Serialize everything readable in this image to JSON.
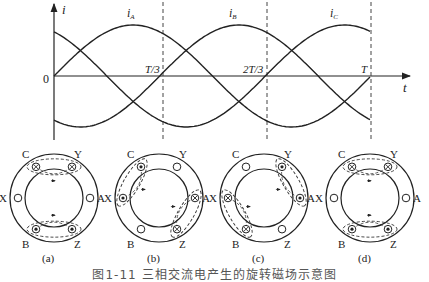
{
  "waveform": {
    "y_axis_label": "i",
    "x_axis_label": "t",
    "origin_label": "0",
    "tick_labels": [
      "T/3",
      "2T/3",
      "T"
    ],
    "curves": [
      {
        "name": "iA",
        "label_main": "i",
        "label_sub": "A",
        "phase_deg": 0
      },
      {
        "name": "iB",
        "label_main": "i",
        "label_sub": "B",
        "phase_deg": -120
      },
      {
        "name": "iC",
        "label_main": "i",
        "label_sub": "C",
        "phase_deg": 120
      }
    ]
  },
  "panels": [
    {
      "id": "a",
      "caption": "(a)"
    },
    {
      "id": "b",
      "caption": "(b)"
    },
    {
      "id": "c",
      "caption": "(c)"
    },
    {
      "id": "d",
      "caption": "(d)"
    }
  ],
  "slot_labels": {
    "C": "C",
    "Y": "Y",
    "X": "X",
    "A": "A",
    "B": "B",
    "Z": "Z"
  },
  "figure_caption": "图1-11  三相交流电产生的旋转磁场示意图",
  "colors": {
    "line": "#222222",
    "background": "#ffffff"
  }
}
